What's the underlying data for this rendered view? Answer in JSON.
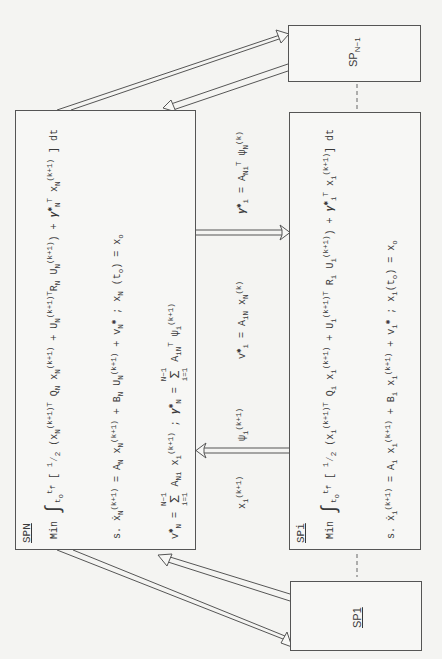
{
  "diagram": {
    "orientation": "rotated 90deg counter-clockwise",
    "colors": {
      "line": "#555555",
      "text": "#3a3a3a",
      "background": "#f4f4f2"
    },
    "boxes": {
      "spn": {
        "title": "SPN",
        "objective": {
          "prefix": "Min",
          "integral_upper": "f",
          "integral_upper_base": "t",
          "integral_lower": "t",
          "integral_lower_sub": "o",
          "body": "[ ½ (x_N^(k+1)T Q_N x_N^(k+1) + U_N^(k+1)T R_N U_N^(k+1)) + γ*_N^T x_N^(k+1) ] dt"
        },
        "constraint": {
          "prefix": "s.",
          "body": "ẋ_N^(k+1) = A_N x_N^(k+1) + B_N U_N^(k+1) + v*_N ; x_N (t_o) = x_o"
        },
        "coordination": {
          "body": "v*_N = Σ_{i=1}^{N−1} A_Ni x_i^(k+1) ; γ*_N = Σ_{i=1}^{N−1} A_iN^T ψ_i^(k+1)"
        }
      },
      "spi": {
        "title": "SPi",
        "objective": {
          "prefix": "Min",
          "body": "[ ½ (x_i^(k+1)T Q_i x_i^(k+1) + U_i^(k+1)T R_i U_i^(k+1)) + γ*_i^T x_i^(k+1) ] dt"
        },
        "constraint": {
          "prefix": "s.",
          "body": "ẋ_i^(k+1) = A_i x_i^(k+1) + B_i x_i^(k+1) + v*_i ; x_i(t_o) = x_o"
        }
      },
      "sp_n_minus_1": {
        "title": "SP",
        "subscript": "N−1"
      },
      "sp1": {
        "title": "SP1"
      }
    },
    "arrows": {
      "to_spi_label": "v*_i = A_iN x_N^(k) ; γ*_i = A_Ni^T ψ_N^(k)",
      "to_spn_label": "x_i^(k+1) ψ_i^(k+1)"
    }
  }
}
